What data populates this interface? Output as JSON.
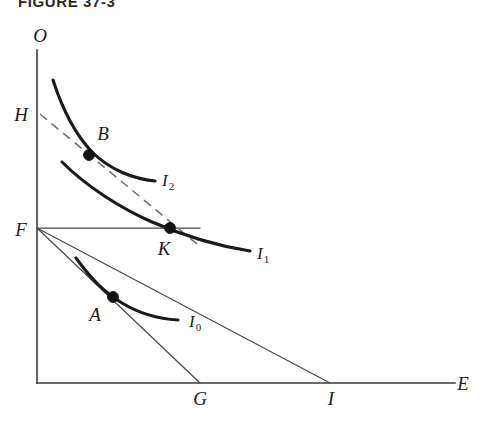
{
  "figure": {
    "title": "FIGURE 37-3",
    "type": "indifference-curve-budget-constraint"
  },
  "axes": {
    "y_label": "O",
    "x_label": "E",
    "origin_x": 37,
    "origin_y": 383,
    "y_top": 50,
    "x_right": 455
  },
  "axis_points": [
    {
      "id": "H",
      "label": "H",
      "x": 37,
      "y": 113,
      "label_x": 14,
      "label_y": 120
    },
    {
      "id": "F",
      "label": "F",
      "x": 37,
      "y": 228,
      "label_x": 14,
      "label_y": 235
    },
    {
      "id": "G",
      "label": "G",
      "x": 200,
      "y": 383,
      "label_x": 193,
      "label_y": 404
    },
    {
      "id": "I",
      "label": "I",
      "x": 330,
      "y": 383,
      "label_x": 327,
      "label_y": 404
    }
  ],
  "equilibrium_points": [
    {
      "id": "A",
      "label": "A",
      "x": 113,
      "y": 297,
      "label_x": 88,
      "label_y": 320,
      "on_curve": "I0"
    },
    {
      "id": "B",
      "label": "B",
      "x": 89,
      "y": 155,
      "label_x": 97,
      "label_y": 138,
      "on_curve": "I2"
    },
    {
      "id": "K",
      "label": "K",
      "x": 170,
      "y": 228,
      "label_x": 156,
      "label_y": 254,
      "on_curve": "I1"
    }
  ],
  "curves": [
    {
      "id": "I0",
      "label": "I",
      "subscript": "0",
      "label_x": 188,
      "label_y": 327,
      "path": "M 76,258 C 92,280 104,292 122,303 C 140,314 160,319 178,320"
    },
    {
      "id": "I1",
      "label": "I",
      "subscript": "1",
      "label_x": 256,
      "label_y": 259,
      "path": "M 62,162 C 86,186 120,208 152,222 C 182,235 218,246 250,251"
    },
    {
      "id": "I2",
      "label": "I",
      "subscript": "2",
      "label_x": 161,
      "label_y": 186,
      "path": "M 53,80 C 62,108 74,133 92,152 C 110,170 134,179 155,181"
    }
  ],
  "budget_lines": [
    {
      "id": "FG",
      "from": "F",
      "to": "G",
      "x1": 37,
      "y1": 228,
      "x2": 200,
      "y2": 383,
      "style": "solid"
    },
    {
      "id": "FI",
      "from": "F",
      "to": "I",
      "x1": 37,
      "y1": 228,
      "x2": 330,
      "y2": 383,
      "style": "solid"
    },
    {
      "id": "HK",
      "from": "H",
      "to": "K-extended",
      "x1": 40,
      "y1": 115,
      "x2": 196,
      "y2": 243,
      "style": "dashed"
    }
  ],
  "guide_lines": [
    {
      "id": "F-horizontal",
      "x1": 37,
      "y1": 228,
      "x2": 200,
      "y2": 228,
      "style": "solid"
    }
  ]
}
